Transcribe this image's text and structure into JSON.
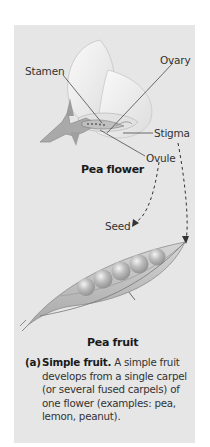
{
  "figure": {
    "panel_color": "#e6e6e6",
    "labels": {
      "stamen": "Stamen",
      "ovary": "Ovary",
      "stigma": "Stigma",
      "ovule": "Ovule",
      "seed": "Seed"
    },
    "flower_caption": "Pea flower",
    "fruit_caption": "Pea fruit",
    "caption": {
      "tag": "(a)",
      "title": "Simple fruit.",
      "body": " A simple fruit develops from a single carpel (or several fused carpels) of one flower (examples: pea, lemon, peanut)."
    }
  }
}
